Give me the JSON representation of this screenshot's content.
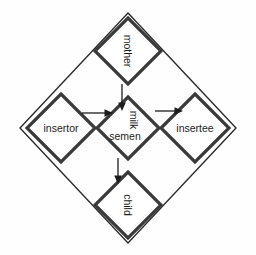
{
  "diagram": {
    "type": "flow-diagram",
    "background_color": "#fefefe",
    "stroke_color": "#3a3a3a",
    "outer_stroke_color": "#2b2b2b",
    "text_color": "#1c1c1c",
    "outer_frame": {
      "shape": "diamond",
      "name": "outer-frame-diamond",
      "center": {
        "x": 128,
        "y": 128
      },
      "half_width": 108,
      "half_height": 115
    },
    "nodes": [
      {
        "id": "mother",
        "label": "mother",
        "shape": "diamond",
        "orientation": "vertical-text",
        "rotation_deg": 90,
        "center": {
          "x": 128,
          "y": 51
        },
        "half_size": 33
      },
      {
        "id": "insertor",
        "label": "insertor",
        "shape": "diamond",
        "orientation": "horizontal-text",
        "rotation_deg": 0,
        "center": {
          "x": 61,
          "y": 128
        },
        "half_size": 34
      },
      {
        "id": "center",
        "label_primary": "milk",
        "label_secondary": "semen",
        "shape": "diamond",
        "orientation": "mixed-text",
        "rotation_deg_primary": 90,
        "rotation_deg_secondary": 0,
        "center": {
          "x": 128,
          "y": 128
        },
        "half_size": 31
      },
      {
        "id": "insertee",
        "label": "insertee",
        "shape": "diamond",
        "orientation": "horizontal-text",
        "rotation_deg": 0,
        "center": {
          "x": 195,
          "y": 128
        },
        "half_size": 34
      },
      {
        "id": "child",
        "label": "child",
        "shape": "diamond",
        "orientation": "vertical-text",
        "rotation_deg": 90,
        "center": {
          "x": 128,
          "y": 205
        },
        "half_size": 33
      }
    ],
    "arrows": [
      {
        "id": "mother-to-center",
        "from": "mother",
        "to": "center",
        "direction": "down",
        "x1": 122,
        "y1": 84,
        "x2": 122,
        "y2": 108
      },
      {
        "id": "insertor-to-center",
        "from": "insertor",
        "to": "center",
        "direction": "right",
        "x1": 82,
        "y1": 113,
        "x2": 112,
        "y2": 113
      },
      {
        "id": "center-to-insertee",
        "from": "center",
        "to": "insertee",
        "direction": "right",
        "x1": 155,
        "y1": 111,
        "x2": 181,
        "y2": 111
      },
      {
        "id": "center-to-child",
        "from": "center",
        "to": "child",
        "direction": "down",
        "x1": 118,
        "y1": 157,
        "x2": 118,
        "y2": 182
      }
    ]
  }
}
